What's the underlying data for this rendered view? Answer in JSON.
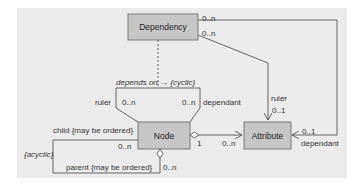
{
  "diagram": {
    "type": "UML class diagram",
    "colors": {
      "background_panel": "#ebebeb",
      "class_fill": "#c6c6c6",
      "class_stroke": "#707070",
      "line": "#555555",
      "text": "#333333"
    },
    "classes": {
      "dependency": "Dependency",
      "node": "Node",
      "attribute": "Attribute"
    },
    "associations": {
      "dependency_to_attribute_dependant": {
        "mult_at_dependency": "0..n",
        "mult_at_attribute": "0..1",
        "role_at_attribute": "dependant"
      },
      "dependency_to_attribute_ruler": {
        "mult_at_dependency": "0..n",
        "mult_at_attribute": "0..1",
        "role_at_attribute": "ruler"
      },
      "node_depends_on": {
        "label": "depends on → {cyclic}",
        "ruler_role": "ruler",
        "ruler_mult": "0..n",
        "dependant_role": "dependant",
        "dependant_mult": "0..n"
      },
      "node_to_attribute": {
        "mult_at_node": "1",
        "mult_at_attribute": "0..n"
      },
      "node_self": {
        "child_role": "child {may be ordered}",
        "child_mult": "0..n",
        "parent_role": "parent {may be ordered}",
        "parent_mult": "0..n",
        "constraint": "{acyclic}"
      }
    }
  }
}
